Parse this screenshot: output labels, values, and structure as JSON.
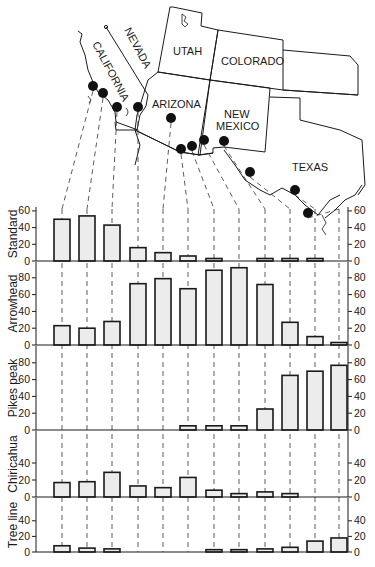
{
  "map": {
    "state_labels": {
      "nevada": "NEVADA",
      "california": "CALIFORNIA",
      "utah": "UTAH",
      "colorado": "COLORADO",
      "arizona": "ARIZONA",
      "new_mexico_1": "NEW",
      "new_mexico_2": "MEXICO",
      "texas": "TEXAS"
    },
    "site_dots": [
      {
        "x": 93,
        "y": 86
      },
      {
        "x": 103,
        "y": 93
      },
      {
        "x": 117,
        "y": 107
      },
      {
        "x": 138,
        "y": 107
      },
      {
        "x": 171,
        "y": 118
      },
      {
        "x": 181,
        "y": 149
      },
      {
        "x": 192,
        "y": 146
      },
      {
        "x": 204,
        "y": 140
      },
      {
        "x": 224,
        "y": 141
      },
      {
        "x": 250,
        "y": 172
      },
      {
        "x": 295,
        "y": 190
      },
      {
        "x": 308,
        "y": 213
      }
    ]
  },
  "chart_data": {
    "type": "bar",
    "title": "",
    "xlabel": "",
    "ylabel": "",
    "categories": [
      "Site 1",
      "Site 2",
      "Site 3",
      "Site 4",
      "Site 5",
      "Site 6",
      "Site 7",
      "Site 8",
      "Site 9",
      "Site 10",
      "Site 11",
      "Site 12"
    ],
    "grid": false,
    "series": [
      {
        "name": "Standard",
        "values": [
          50,
          54,
          43,
          16,
          10,
          6,
          3,
          0,
          3,
          3,
          3,
          0
        ],
        "ylim": [
          0,
          60
        ],
        "ticks": [
          0,
          20,
          40,
          60
        ]
      },
      {
        "name": "Arrowhead",
        "values": [
          23,
          20,
          28,
          73,
          79,
          67,
          89,
          92,
          72,
          27,
          10,
          3
        ],
        "ylim": [
          0,
          100
        ],
        "ticks": [
          0,
          20,
          40,
          60,
          80
        ]
      },
      {
        "name": "Pikes peak",
        "values": [
          0,
          0,
          0,
          0,
          0,
          5,
          5,
          5,
          25,
          65,
          70,
          77
        ],
        "ylim": [
          0,
          100
        ],
        "ticks": [
          0,
          20,
          40,
          60,
          80
        ]
      },
      {
        "name": "Chiricahua",
        "values": [
          17,
          18,
          29,
          13,
          11,
          23,
          8,
          4,
          6,
          4,
          0,
          0
        ],
        "ylim": [
          0,
          80
        ],
        "ticks": [
          0,
          20,
          40
        ]
      },
      {
        "name": "Tree line",
        "values": [
          8,
          5,
          4,
          0,
          0,
          0,
          3,
          3,
          4,
          6,
          14,
          18
        ],
        "ylim": [
          0,
          60
        ],
        "ticks": [
          0,
          20,
          40
        ]
      }
    ],
    "layout": "stacked panels sharing x positions, left and right y-axes, dashed leader lines from map sites to bars"
  },
  "colors": {
    "bar_fill": "#ececec",
    "stroke": "#1a1a1a",
    "background": "#ffffff"
  }
}
